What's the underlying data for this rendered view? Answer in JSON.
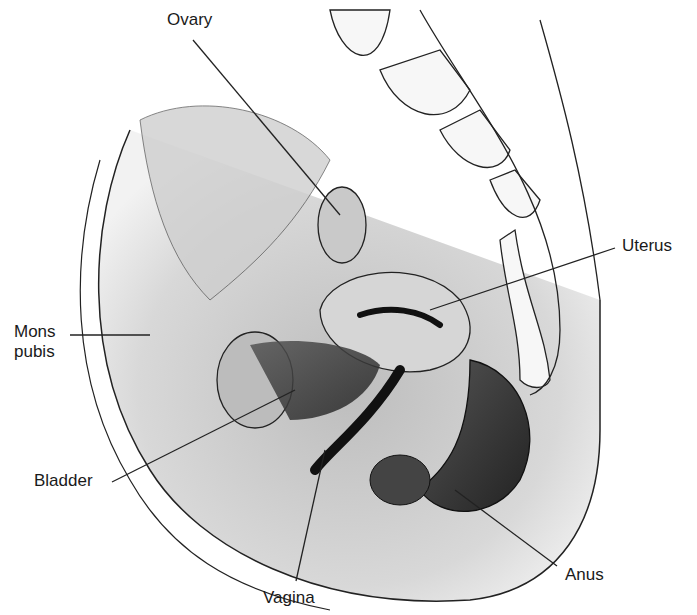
{
  "diagram": {
    "labels": [
      {
        "id": "ovary",
        "text": "Ovary",
        "x": 167,
        "y": 10
      },
      {
        "id": "uterus",
        "text": "Uterus",
        "x": 622,
        "y": 235
      },
      {
        "id": "mons-pubis",
        "text": "Mons\npubis",
        "x": 14,
        "y": 322
      },
      {
        "id": "bladder",
        "text": "Bladder",
        "x": 34,
        "y": 470
      },
      {
        "id": "anus",
        "text": "Anus",
        "x": 565,
        "y": 565
      },
      {
        "id": "vagina",
        "text": "Vagina",
        "x": 263,
        "y": 587
      }
    ],
    "leader_lines": [
      {
        "id": "ovary",
        "x1": 193,
        "y1": 40,
        "x2": 340,
        "y2": 215
      },
      {
        "id": "uterus",
        "x1": 615,
        "y1": 248,
        "x2": 430,
        "y2": 310
      },
      {
        "id": "mons-pubis",
        "x1": 70,
        "y1": 335,
        "x2": 150,
        "y2": 335
      },
      {
        "id": "bladder",
        "x1": 112,
        "y1": 482,
        "x2": 295,
        "y2": 390
      },
      {
        "id": "anus",
        "x1": 557,
        "y1": 566,
        "x2": 455,
        "y2": 490
      },
      {
        "id": "vagina",
        "x1": 296,
        "y1": 581,
        "x2": 325,
        "y2": 450
      }
    ]
  }
}
